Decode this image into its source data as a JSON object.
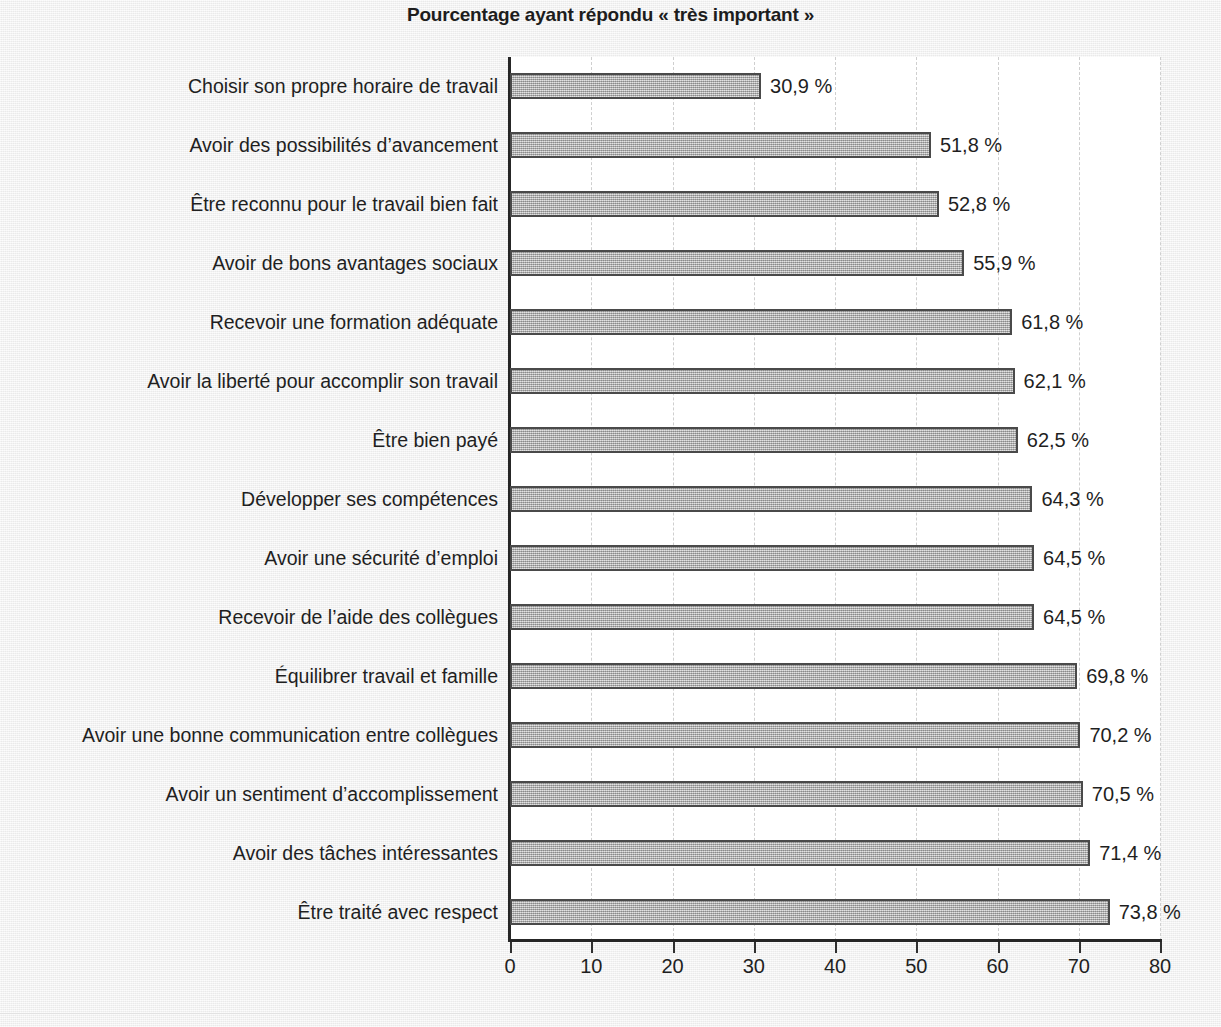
{
  "chart_data": {
    "type": "bar",
    "orientation": "horizontal",
    "title": "Pourcentage ayant répondu « très important »",
    "xlabel": "",
    "ylabel": "",
    "xlim": [
      0,
      80
    ],
    "grid": "vertical-dashed",
    "legend": "none",
    "value_suffix": " %",
    "decimal_separator": ",",
    "categories": [
      "Choisir son propre horaire de travail",
      "Avoir des possibilités d’avancement",
      "Être reconnu pour le travail bien fait",
      "Avoir de bons avantages sociaux",
      "Recevoir une formation adéquate",
      "Avoir la liberté pour accomplir son travail",
      "Être bien payé",
      "Développer ses compétences",
      "Avoir une sécurité d’emploi",
      "Recevoir de l’aide des collègues",
      "Équilibrer travail et famille",
      "Avoir une bonne communication entre collègues",
      "Avoir un sentiment d’accomplissement",
      "Avoir des tâches intéressantes",
      "Être traité avec respect"
    ],
    "values": [
      30.9,
      51.8,
      52.8,
      55.9,
      61.8,
      62.1,
      62.5,
      64.3,
      64.5,
      64.5,
      69.8,
      70.2,
      70.5,
      71.4,
      73.8
    ],
    "value_labels": [
      "30,9 %",
      "51,8 %",
      "52,8 %",
      "55,9 %",
      "61,8 %",
      "62,1 %",
      "62,5 %",
      "64,3 %",
      "64,5 %",
      "64,5 %",
      "69,8 %",
      "70,2 %",
      "70,5 %",
      "71,4 %",
      "73,8 %"
    ],
    "xticks": [
      0,
      10,
      20,
      30,
      40,
      50,
      60,
      70,
      80
    ],
    "xtick_labels": [
      "0",
      "10",
      "20",
      "30",
      "40",
      "50",
      "60",
      "70",
      "80"
    ],
    "colors": {
      "bar_fill": "#a9a9a9",
      "bar_border": "#4a4a4a",
      "plot_background": "#ffffff",
      "page_background": "#f1f1f1",
      "text": "#1f1f1f",
      "gridline": "#cfcfcf",
      "axis": "#262626"
    }
  }
}
